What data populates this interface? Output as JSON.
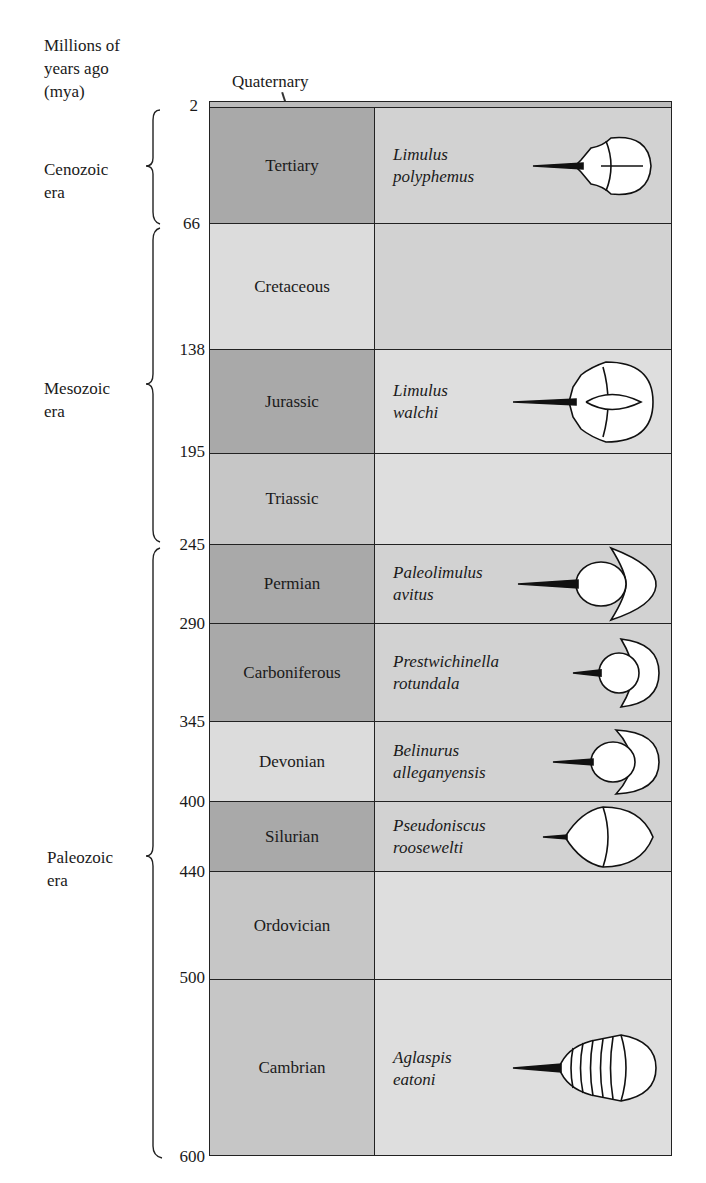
{
  "axis": {
    "title_line1": "Millions of",
    "title_line2": "years ago",
    "title_line3": "(mya)"
  },
  "quaternary_label": "Quaternary",
  "ticks": [
    "2",
    "66",
    "138",
    "195",
    "245",
    "290",
    "345",
    "400",
    "440",
    "500",
    "600"
  ],
  "eras": [
    {
      "line1": "Cenozoic",
      "line2": "era"
    },
    {
      "line1": "Mesozoic",
      "line2": "era"
    },
    {
      "line1": "Paleozoic",
      "line2": "era"
    }
  ],
  "periods": [
    {
      "name": "Tertiary",
      "species1": "Limulus",
      "species2": "polyphemus"
    },
    {
      "name": "Cretaceous",
      "species1": "",
      "species2": ""
    },
    {
      "name": "Jurassic",
      "species1": "Limulus",
      "species2": "walchi"
    },
    {
      "name": "Triassic",
      "species1": "",
      "species2": ""
    },
    {
      "name": "Permian",
      "species1": "Paleolimulus",
      "species2": "avitus"
    },
    {
      "name": "Carboniferous",
      "species1": "Prestwichinella",
      "species2": "rotundala"
    },
    {
      "name": "Devonian",
      "species1": "Belinurus",
      "species2": "alleganyensis"
    },
    {
      "name": "Silurian",
      "species1": "Pseudoniscus",
      "species2": "roosewelti"
    },
    {
      "name": "Ordovician",
      "species1": "",
      "species2": ""
    },
    {
      "name": "Cambrian",
      "species1": "Aglaspis",
      "species2": "eatoni"
    }
  ]
}
